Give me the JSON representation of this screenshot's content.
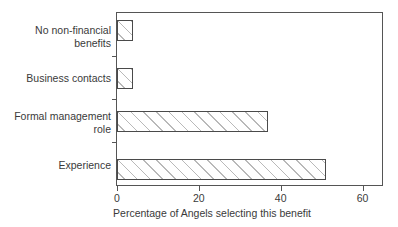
{
  "chart_data": {
    "type": "bar",
    "orientation": "horizontal",
    "title": "",
    "xlabel": "Percentage of Angels selecting this benefit",
    "ylabel": "",
    "categories": [
      "Experience",
      "Formal management role",
      "Business contacts",
      "No non-financial benefits"
    ],
    "values": [
      51,
      37,
      4,
      4
    ],
    "xlim": [
      0,
      65
    ],
    "xticks": [
      0,
      20,
      40,
      60
    ],
    "xtick_labels": [
      "0",
      "20",
      "40",
      "60"
    ],
    "grid": false,
    "legend": null,
    "series": [
      {
        "name": "Percentage of Angels selecting this benefit",
        "values": [
          51,
          37,
          4,
          4
        ]
      }
    ],
    "bar_fill": "#ffffff",
    "bar_hatch": "/",
    "bar_hatch_color": "#b9b9b9",
    "bar_edge_color": "#4a4a4a",
    "axis_color": "#555555",
    "text_color": "#3a3a3a",
    "background": "#ffffff"
  },
  "axis": {
    "x_title": "Percentage of Angels selecting this benefit",
    "tick_labels": [
      "0",
      "20",
      "40",
      "60"
    ]
  },
  "categories": [
    {
      "label": "No non-financial\nbenefits",
      "value": 4
    },
    {
      "label": "Business contacts",
      "value": 4
    },
    {
      "label": "Formal management\nrole",
      "value": 37
    },
    {
      "label": "Experience",
      "value": 51
    }
  ]
}
